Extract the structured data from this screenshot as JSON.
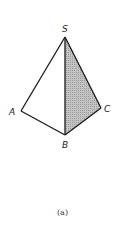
{
  "figure": {
    "caption": "(a)",
    "colors": {
      "edge": "#1a1a1a",
      "shade": "#b8b8b8",
      "shade_dot": "#8a8a8a",
      "background": "#ffffff"
    },
    "vertices": [
      {
        "name": "S",
        "label": "S",
        "x": 65,
        "y": 37
      },
      {
        "name": "A",
        "label": "A",
        "x": 21,
        "y": 111
      },
      {
        "name": "B",
        "label": "B",
        "x": 65,
        "y": 135
      },
      {
        "name": "C",
        "label": "C",
        "x": 101,
        "y": 108
      }
    ],
    "edges": [
      [
        "S",
        "A"
      ],
      [
        "S",
        "B"
      ],
      [
        "S",
        "C"
      ],
      [
        "A",
        "B"
      ],
      [
        "B",
        "C"
      ]
    ],
    "shaded_face": [
      "S",
      "B",
      "C"
    ]
  }
}
